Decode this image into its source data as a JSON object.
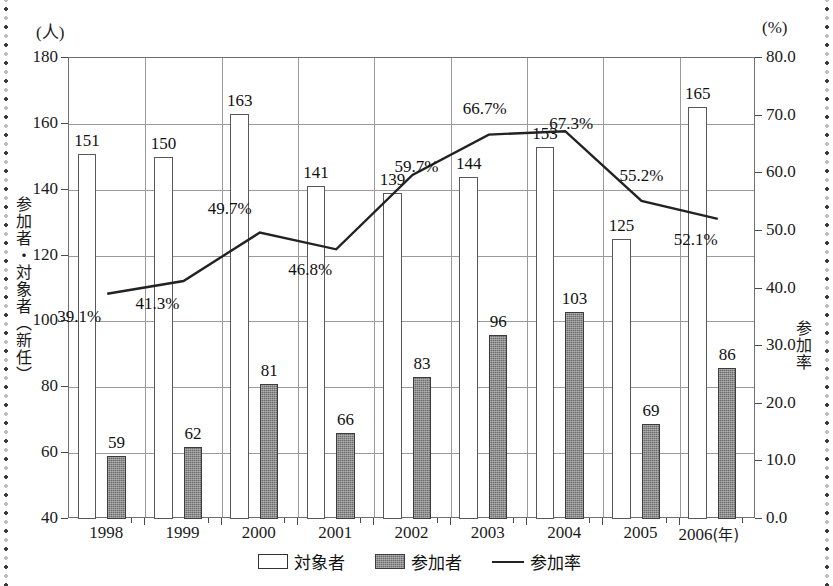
{
  "chart_data": {
    "type": "bar",
    "title": "",
    "subtitle": "",
    "categories": [
      "1998",
      "1999",
      "2000",
      "2001",
      "2002",
      "2003",
      "2004",
      "2005",
      "2006"
    ],
    "x_axis_unit": "(年)",
    "series": [
      {
        "name": "対象者",
        "type": "bar",
        "style": "open",
        "axis": "left",
        "values": [
          151,
          150,
          163,
          141,
          139,
          144,
          153,
          125,
          165
        ]
      },
      {
        "name": "参加者",
        "type": "bar",
        "style": "filled",
        "axis": "left",
        "values": [
          59,
          62,
          81,
          66,
          83,
          96,
          103,
          69,
          86
        ]
      },
      {
        "name": "参加率",
        "type": "line",
        "axis": "right",
        "values": [
          39.1,
          41.3,
          49.7,
          46.8,
          59.7,
          66.7,
          67.3,
          55.2,
          52.1
        ],
        "value_labels": [
          "39.1%",
          "41.3%",
          "49.7%",
          "46.8%",
          "59.7%",
          "66.7%",
          "67.3%",
          "55.2%",
          "52.1%"
        ]
      }
    ],
    "left_axis": {
      "label": "参加者・対象者（新任）",
      "unit": "(人)",
      "min": 40,
      "max": 180,
      "tick_step": 20,
      "ticks": [
        "180",
        "160",
        "140",
        "120",
        "100",
        "80",
        "60",
        "40"
      ]
    },
    "right_axis": {
      "label": "参加率",
      "unit": "(%)",
      "min": 0.0,
      "max": 80.0,
      "tick_step": 10.0,
      "ticks": [
        "80.0",
        "70.0",
        "60.0",
        "50.0",
        "40.0",
        "30.0",
        "20.0",
        "10.0",
        "0.0"
      ]
    },
    "grid": true,
    "legend_position": "bottom",
    "legend": [
      {
        "label": "対象者",
        "marker": "open-square"
      },
      {
        "label": "参加者",
        "marker": "filled-square"
      },
      {
        "label": "参加率",
        "marker": "line"
      }
    ],
    "colors": {
      "open_bar_fill": "#ffffff",
      "open_bar_stroke": "#585858",
      "filled_bar_fill": "#6d6d6d",
      "filled_bar_stroke": "#3c3c3c",
      "line": "#222222",
      "grid": "#9a9a9a",
      "frame": "#6f6f6f",
      "text": "#111111",
      "background": "#ffffff"
    }
  }
}
